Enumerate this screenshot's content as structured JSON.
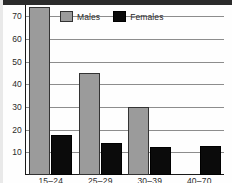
{
  "chart_data": {
    "type": "bar",
    "title": "",
    "xlabel": "",
    "ylabel": "",
    "categories": [
      "15–24",
      "25–29",
      "30–39",
      "40–70"
    ],
    "series": [
      {
        "name": "Males",
        "values": [
          74,
          45,
          30,
          0
        ],
        "color": "#9b9b9b"
      },
      {
        "name": "Females",
        "values": [
          17.5,
          14,
          12.5,
          13
        ],
        "color": "#0b0b0b"
      }
    ],
    "ylim": [
      0,
      75
    ],
    "yticks": [
      10,
      20,
      30,
      40,
      50,
      60,
      70
    ],
    "ytick_labels": [
      "10",
      "20",
      "30",
      "40",
      "50",
      "60",
      "70"
    ],
    "grid": true,
    "grid_axis": "y",
    "legend_position": "top-center"
  },
  "legend": {
    "items": [
      {
        "label": "Males"
      },
      {
        "label": "Females"
      }
    ]
  },
  "colors": {
    "males": "#9b9b9b",
    "females": "#0b0b0b",
    "gridline": "#8d8d8d",
    "axis": "#1a1a1a",
    "background": "#fefefe"
  }
}
